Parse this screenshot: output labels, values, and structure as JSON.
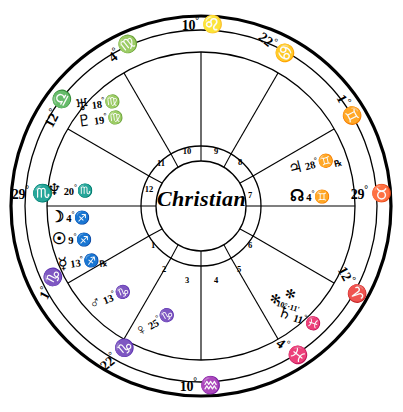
{
  "chart": {
    "native_name": "Christian",
    "ink_color": "#000000",
    "paper_color": "#ffffff",
    "center": {
      "cx": 201,
      "cy": 206
    },
    "radii": {
      "outer_rim": 192,
      "mid_ring": 172,
      "inner_ring": 118,
      "numeral_outer": 60,
      "numeral_inner": 45
    }
  },
  "house_numbers": [
    {
      "n": "1",
      "x": 153,
      "y": 246
    },
    {
      "n": "2",
      "x": 164,
      "y": 270
    },
    {
      "n": "3",
      "x": 187,
      "y": 281
    },
    {
      "n": "4",
      "x": 216,
      "y": 281
    },
    {
      "n": "5",
      "x": 239,
      "y": 270
    },
    {
      "n": "6",
      "x": 250,
      "y": 246
    },
    {
      "n": "7",
      "x": 250,
      "y": 196
    },
    {
      "n": "8",
      "x": 240,
      "y": 163
    },
    {
      "n": "9",
      "x": 216,
      "y": 152
    },
    {
      "n": "10",
      "x": 187,
      "y": 152
    },
    {
      "n": "11",
      "x": 161,
      "y": 164
    },
    {
      "n": "12",
      "x": 149,
      "y": 190
    }
  ],
  "cusps": [
    {
      "name": "cusp-10-midheaven",
      "degree": "10",
      "sign_glyph": "♌",
      "sign_name": "Leo",
      "x": 202,
      "y": 24,
      "rot": 0,
      "align": "center"
    },
    {
      "name": "cusp-11",
      "degree": "4",
      "sign_glyph": "♍",
      "sign_name": "Virgo",
      "x": 123,
      "y": 48,
      "rot": -38,
      "align": "center"
    },
    {
      "name": "cusp-12",
      "degree": "12",
      "sign_glyph": "♎",
      "sign_name": "Libra",
      "x": 57,
      "y": 108,
      "rot": -62,
      "align": "center"
    },
    {
      "name": "cusp-1-ascendant",
      "degree": "29",
      "sign_glyph": "♏",
      "sign_name": "Scorpio",
      "x": 32,
      "y": 193,
      "rot": 0,
      "align": "center"
    },
    {
      "name": "cusp-2",
      "degree": "1",
      "sign_glyph": "♑",
      "sign_name": "Capricorn",
      "x": 50,
      "y": 283,
      "rot": -62,
      "align": "center"
    },
    {
      "name": "cusp-3",
      "degree": "22",
      "sign_glyph": "♑",
      "sign_name": "Capricorn",
      "x": 117,
      "y": 354,
      "rot": -40,
      "align": "center"
    },
    {
      "name": "cusp-4-imum-coeli",
      "degree": "10",
      "sign_glyph": "♒",
      "sign_name": "Aquarius",
      "x": 200,
      "y": 385,
      "rot": 0,
      "align": "center"
    },
    {
      "name": "cusp-5",
      "degree": "4",
      "sign_glyph": "♓",
      "sign_name": "Pisces",
      "x": 292,
      "y": 351,
      "rot": 38,
      "align": "center"
    },
    {
      "name": "cusp-6",
      "degree": "12",
      "sign_glyph": "♈",
      "sign_name": "Aries",
      "x": 352,
      "y": 285,
      "rot": 62,
      "align": "center"
    },
    {
      "name": "cusp-7-descendant",
      "degree": "29",
      "sign_glyph": "♉",
      "sign_name": "Taurus",
      "x": 371,
      "y": 193,
      "rot": 0,
      "align": "center"
    },
    {
      "name": "cusp-8",
      "degree": "1",
      "sign_glyph": "♊",
      "sign_name": "Gemini",
      "x": 349,
      "y": 110,
      "rot": 62,
      "align": "center"
    },
    {
      "name": "cusp-9",
      "degree": "22",
      "sign_glyph": "♋",
      "sign_name": "Cancer",
      "x": 277,
      "y": 47,
      "rot": 38,
      "align": "center"
    }
  ],
  "planets": [
    {
      "name": "planet-neptune",
      "glyph": "♆",
      "planet_name": "Neptune",
      "degree": "20",
      "minute": "",
      "sign_glyph": "♏",
      "sign_name": "Scorpio",
      "retrograde": false,
      "house": "12",
      "x": 47,
      "y": 182,
      "rot": 0,
      "align": "left"
    },
    {
      "name": "planet-moon",
      "glyph": "☽",
      "planet_name": "Moon",
      "degree": "4",
      "minute": "",
      "sign_glyph": "♐",
      "sign_name": "Sagittarius",
      "retrograde": false,
      "house": "1",
      "x": 50,
      "y": 209,
      "rot": 0,
      "align": "left"
    },
    {
      "name": "planet-sun",
      "glyph": "☉",
      "planet_name": "Sun",
      "degree": "9",
      "minute": "",
      "sign_glyph": "♐",
      "sign_name": "Sagittarius",
      "retrograde": false,
      "house": "1",
      "x": 52,
      "y": 231,
      "rot": 0,
      "align": "left"
    },
    {
      "name": "planet-mercury",
      "glyph": "☿",
      "planet_name": "Mercury",
      "degree": "13",
      "minute": "",
      "sign_glyph": "♐",
      "sign_name": "Sagittarius",
      "retrograde": true,
      "house": "1",
      "x": 58,
      "y": 253,
      "rot": -8,
      "align": "left"
    },
    {
      "name": "planet-mars",
      "glyph": "♂",
      "planet_name": "Mars",
      "degree": "13",
      "minute": "",
      "sign_glyph": "♑",
      "sign_name": "Capricorn",
      "retrograde": false,
      "house": "2",
      "x": 88,
      "y": 289,
      "rot": -22,
      "align": "left"
    },
    {
      "name": "planet-venus",
      "glyph": "♀",
      "planet_name": "Venus",
      "degree": "25",
      "minute": "",
      "sign_glyph": "♑",
      "sign_name": "Capricorn",
      "retrograde": false,
      "house": "2",
      "x": 133,
      "y": 314,
      "rot": -30,
      "align": "left"
    },
    {
      "name": "planet-saturn",
      "glyph": "♄",
      "planet_name": "Saturn",
      "degree": "11",
      "minute": "",
      "sign_glyph": "♓",
      "sign_name": "Pisces",
      "retrograde": false,
      "house": "4",
      "x": 277,
      "y": 310,
      "rot": 18,
      "align": "left"
    },
    {
      "name": "planet-jupiter",
      "glyph": "♃",
      "planet_name": "Jupiter",
      "degree": "28",
      "minute": "",
      "sign_glyph": "♊",
      "sign_name": "Gemini",
      "retrograde": true,
      "house": "8",
      "x": 288,
      "y": 155,
      "rot": -14,
      "align": "left"
    },
    {
      "name": "planet-north-node",
      "glyph": "☊",
      "planet_name": "North Node",
      "degree": "4",
      "minute": "",
      "sign_glyph": "♊",
      "sign_name": "Gemini",
      "retrograde": false,
      "house": "7",
      "x": 290,
      "y": 188,
      "rot": 0,
      "align": "left"
    }
  ],
  "planet_stack": {
    "name": "planet-cluster-uranus-pluto",
    "x": 76,
    "y": 95,
    "rot": -8,
    "rows": [
      {
        "name": "planet-uranus",
        "glyph": "♅",
        "planet_name": "Uranus",
        "degree": "18",
        "sign_glyph": "♍",
        "sign_name": "Virgo"
      },
      {
        "name": "planet-pluto",
        "glyph": "♇",
        "planet_name": "Pluto",
        "degree": "19",
        "sign_glyph": "♍",
        "sign_name": "Virgo"
      }
    ]
  },
  "aspect_marks": [
    {
      "name": "sextile-mark-saturn",
      "glyph": "✻",
      "x": 270,
      "y": 292,
      "rot": 14
    },
    {
      "name": "sextile-mark-saturn-2",
      "glyph": "✻",
      "x": 285,
      "y": 287,
      "rot": 14
    }
  ],
  "minute_labels": [
    {
      "name": "saturn-minutes",
      "text": "10°·11'",
      "x": 276,
      "y": 303,
      "rot": 16
    }
  ]
}
